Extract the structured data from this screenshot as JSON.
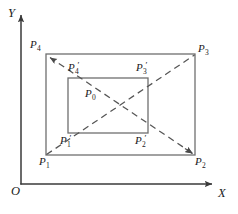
{
  "figure": {
    "type": "geometry-diagram",
    "axes": {
      "x_label": "X",
      "y_label": "Y",
      "origin_label": "O",
      "x_axis": {
        "x1": 21,
        "y1": 184,
        "x2": 215,
        "y2": 184,
        "arrow": "end"
      },
      "y_axis": {
        "x1": 21,
        "y1": 184,
        "x2": 21,
        "y2": 12,
        "arrow": "end"
      }
    },
    "outer_rect": {
      "left": 46,
      "top": 54,
      "right": 195,
      "bottom": 155,
      "stroke": "#6b6b6b"
    },
    "inner_rect": {
      "left": 68,
      "top": 78,
      "right": 148,
      "bottom": 133,
      "stroke": "#6b6b6b"
    },
    "diagonals": [
      {
        "name": "P1-to-P3",
        "x1": 46,
        "y1": 155,
        "x2": 195,
        "y2": 55,
        "dashed": true,
        "arrow": "none"
      },
      {
        "name": "P2-to-P4",
        "x1": 195,
        "y1": 155,
        "x2": 46,
        "y2": 54,
        "dashed": true,
        "arrow": "both"
      }
    ],
    "center_point": {
      "x": 97,
      "y": 105,
      "label": "P0"
    },
    "labels": {
      "y": "Y",
      "x": "X",
      "origin": "O",
      "P1": {
        "base": "P",
        "sub": "1",
        "prime": "",
        "x": 39,
        "y": 156
      },
      "P2": {
        "base": "P",
        "sub": "2",
        "prime": "",
        "x": 195,
        "y": 156
      },
      "P3": {
        "base": "P",
        "sub": "3",
        "prime": "",
        "x": 198,
        "y": 43
      },
      "P4": {
        "base": "P",
        "sub": "4",
        "prime": "",
        "x": 30,
        "y": 39
      },
      "P1p": {
        "base": "P",
        "sub": "1",
        "prime": "′",
        "x": 60,
        "y": 135
      },
      "P2p": {
        "base": "P",
        "sub": "2",
        "prime": "′",
        "x": 135,
        "y": 135
      },
      "P3p": {
        "base": "P",
        "sub": "3",
        "prime": "′",
        "x": 136,
        "y": 62
      },
      "P4p": {
        "base": "P",
        "sub": "4",
        "prime": "′",
        "x": 68,
        "y": 62
      },
      "P0": {
        "base": "P",
        "sub": "0",
        "prime": "",
        "x": 85,
        "y": 88
      }
    },
    "colors": {
      "line": "#6b6b6b",
      "dash": "#5a5a5a",
      "axis": "#4a4a4a",
      "text": "#1a1a1a",
      "background": "#ffffff"
    }
  }
}
